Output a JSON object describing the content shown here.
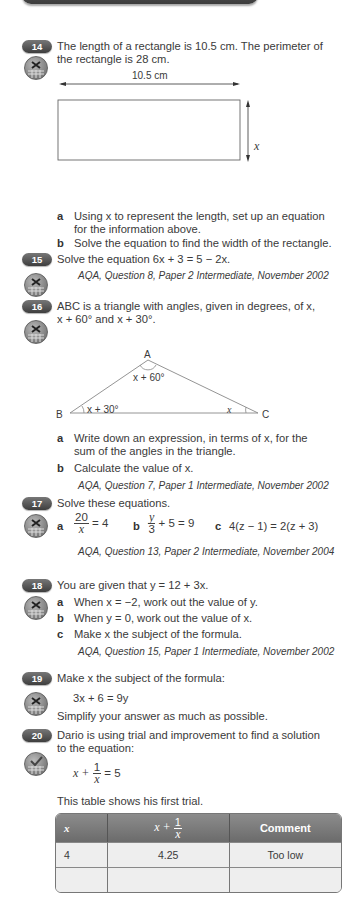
{
  "q14": {
    "number": "14",
    "text_line1": "The length of a rectangle is 10.5 cm. The perimeter of",
    "text_line2": "the rectangle is 28 cm.",
    "diagram": {
      "width_label": "10.5 cm",
      "height_label": "x"
    },
    "part_a_label": "a",
    "part_a_line1": "Using x to represent the length, set up an equation",
    "part_a_line2": "for the information above.",
    "part_b_label": "b",
    "part_b": "Solve the equation to find the width of the rectangle."
  },
  "q15": {
    "number": "15",
    "text": "Solve the equation 6x + 3 = 5 − 2x.",
    "source": "AQA, Question 8, Paper 2 Intermediate, November 2002"
  },
  "q16": {
    "number": "16",
    "text_line1": "ABC is a triangle with angles, given in degrees, of x,",
    "text_line2": "x + 60° and x + 30°.",
    "diagram": {
      "A": "A",
      "B": "B",
      "C": "C",
      "angle_A": "x + 60°",
      "angle_B": "x + 30°",
      "angle_C": "x"
    },
    "part_a_label": "a",
    "part_a_line1": "Write down an expression, in terms of x, for the",
    "part_a_line2": "sum of the angles in the triangle.",
    "part_b_label": "b",
    "part_b": "Calculate the value of x.",
    "source": "AQA, Question 7, Paper 1 Intermediate, November 2002"
  },
  "q17": {
    "number": "17",
    "text": "Solve these equations.",
    "a_label": "a",
    "a_num": "20",
    "a_den": "x",
    "a_rest": "= 4",
    "b_label": "b",
    "b_num": "y",
    "b_den": "3",
    "b_rest": "+ 5 = 9",
    "c_label": "c",
    "c_eq": "4(z − 1) = 2(z + 3)",
    "source": "AQA, Question 13, Paper 2 Intermediate, November 2004"
  },
  "q18": {
    "number": "18",
    "text": "You are given that y = 12 + 3x.",
    "a_label": "a",
    "a": "When x = −2, work out the value of y.",
    "b_label": "b",
    "b": "When y = 0, work out the value of x.",
    "c_label": "c",
    "c": "Make x the subject of the formula.",
    "source": "AQA, Question 15, Paper 1 Intermediate, November 2002"
  },
  "q19": {
    "number": "19",
    "text": "Make x the subject of the formula:",
    "formula": "3x + 6 = 9y",
    "note": "Simplify your answer as much as possible."
  },
  "q20": {
    "number": "20",
    "text_line1": "Dario is using trial and improvement to find a solution",
    "text_line2": "to the equation:",
    "eq_left": "x +",
    "eq_num": "1",
    "eq_den": "x",
    "eq_right": "= 5",
    "table_intro": "This table shows his first trial.",
    "table": {
      "headers": [
        "x",
        "x + 1/x",
        "Comment"
      ],
      "rows": [
        [
          "4",
          "4.25",
          "Too low"
        ],
        [
          "",
          "",
          ""
        ]
      ]
    }
  }
}
